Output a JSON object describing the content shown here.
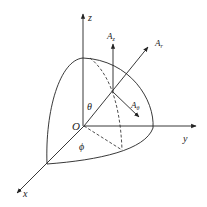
{
  "diagram": {
    "colors": {
      "stroke": "#222222",
      "background": "#ffffff"
    },
    "axes": {
      "x": {
        "label": "x"
      },
      "y": {
        "label": "y"
      },
      "z": {
        "label": "z"
      }
    },
    "origin": {
      "label": "O"
    },
    "angles": {
      "theta": {
        "label": "θ"
      },
      "phi": {
        "label": "ϕ"
      }
    },
    "vectors": [
      {
        "name": "A_z",
        "base": "A",
        "sub": "z"
      },
      {
        "name": "A_r",
        "base": "A",
        "sub": "r"
      },
      {
        "name": "A_theta",
        "base": "A",
        "sub": "θ"
      }
    ]
  }
}
